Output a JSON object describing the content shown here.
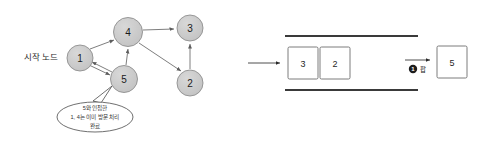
{
  "diagram": {
    "start_label": "시작 노드",
    "colors": {
      "node_fill": "#c9c9c9",
      "node_stroke": "#8f8f8f",
      "edge": "#6f6f6f",
      "box_stroke": "#6e6e6e",
      "rail": "#3a3a3a",
      "badge_fill": "#1c1c1c",
      "background": "#ffffff",
      "text": "#1f1f1f"
    },
    "graph": {
      "nodes": [
        {
          "id": "node-1",
          "label": "1",
          "cx": 80,
          "cy": 58,
          "r": 13
        },
        {
          "id": "node-2",
          "label": "2",
          "cx": 190,
          "cy": 83,
          "r": 13
        },
        {
          "id": "node-3",
          "label": "3",
          "cx": 190,
          "cy": 28,
          "r": 13
        },
        {
          "id": "node-4",
          "label": "4",
          "cx": 128,
          "cy": 32,
          "r": 14.5
        },
        {
          "id": "node-5",
          "label": "5",
          "cx": 124,
          "cy": 79,
          "r": 13.5
        }
      ],
      "edges": [
        {
          "from": "1",
          "to": "4"
        },
        {
          "from": "4",
          "to": "3"
        },
        {
          "from": "5",
          "to": "4"
        },
        {
          "from": "4",
          "to": "2"
        },
        {
          "from": "2",
          "to": "3"
        },
        {
          "from": "1",
          "to": "5"
        },
        {
          "from": "5",
          "to": "1"
        }
      ]
    },
    "callout": {
      "lines": [
        "5와 인접한",
        "1, 4는 이미 방문 처리",
        "완료"
      ],
      "cx": 95,
      "cy": 117,
      "rx": 38,
      "ry": 15
    },
    "stack": {
      "rail_top_y": 36,
      "rail_bottom_y": 90,
      "rail_x1": 285,
      "rail_x2": 418,
      "items": [
        {
          "label": "3",
          "x": 288,
          "y": 47,
          "w": 30,
          "h": 32
        },
        {
          "label": "2",
          "x": 320,
          "y": 47,
          "w": 30,
          "h": 32
        }
      ],
      "incoming_arrow": {
        "x1": 248,
        "y1": 63,
        "x2": 282,
        "y2": 63
      }
    },
    "popped": {
      "badge_number": "1",
      "operation_label": "팝",
      "box": {
        "label": "5",
        "x": 437,
        "y": 46,
        "w": 30,
        "h": 32
      },
      "arrow": {
        "x1": 405,
        "y1": 60,
        "x2": 432,
        "y2": 60
      }
    }
  }
}
